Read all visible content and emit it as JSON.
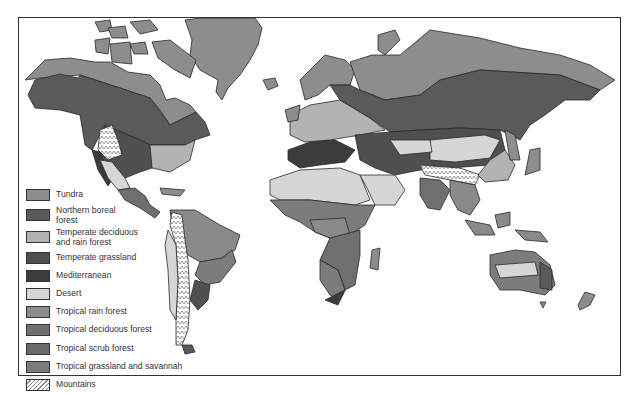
{
  "colors": {
    "tundra": "#8d8d8d",
    "boreal": "#5a5a5a",
    "temperate_deciduous": "#b3b3b3",
    "temperate_grassland": "#4f4f4f",
    "mediterranean": "#3c3c3c",
    "desert": "#d6d6d6",
    "tropical_rain": "#8a8a8a",
    "tropical_deciduous": "#6f6f6f",
    "tropical_scrub": "#6a6a6a",
    "tropical_savannah": "#7c7c7c",
    "mountains": "#ffffff",
    "outline": "#2a2a2a"
  },
  "legend": {
    "items": [
      {
        "key": "tundra",
        "label": "Tundra"
      },
      {
        "key": "boreal",
        "label": "Northern boreal\nforest"
      },
      {
        "key": "temperate_deciduous",
        "label": "Temperate deciduous\nand rain forest"
      },
      {
        "key": "temperate_grassland",
        "label": "Temperate grassland"
      },
      {
        "key": "mediterranean",
        "label": "Mediterranean"
      },
      {
        "key": "desert",
        "label": "Desert"
      },
      {
        "key": "tropical_rain",
        "label": "Tropical rain forest"
      },
      {
        "key": "tropical_deciduous",
        "label": "Tropical deciduous forest"
      },
      {
        "key": "tropical_scrub",
        "label": "Tropical scrub forest"
      },
      {
        "key": "tropical_savannah",
        "label": "Tropical grassland and savannah"
      },
      {
        "key": "mountains",
        "label": "Mountains"
      }
    ]
  }
}
